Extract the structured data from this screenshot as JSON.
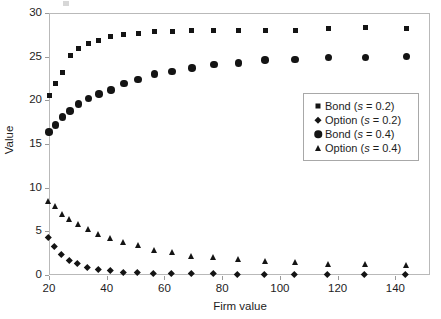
{
  "chart_data": {
    "type": "scatter",
    "title": "",
    "xlabel": "Firm value",
    "ylabel": "Value",
    "xlim": [
      20,
      152
    ],
    "ylim": [
      0,
      30
    ],
    "xticks": [
      20,
      40,
      60,
      80,
      100,
      120,
      140
    ],
    "yticks": [
      0,
      5,
      10,
      15,
      20,
      25,
      30
    ],
    "grid": false,
    "legend_position": "upper-right-inside",
    "x": [
      20,
      22.2,
      24.6,
      27.3,
      30.3,
      33.6,
      37.3,
      41.4,
      45.9,
      50.9,
      56.5,
      62.7,
      69.5,
      77.1,
      85.6,
      94.9,
      105.3,
      116.8,
      129.6,
      143.8
    ],
    "series": [
      {
        "name": "Bond (s = 0.2)",
        "marker": "square",
        "color": "#141414",
        "values": [
          20.6,
          21.9,
          23.2,
          25.1,
          25.9,
          26.5,
          26.9,
          27.3,
          27.5,
          27.7,
          27.9,
          27.9,
          28.0,
          28.0,
          28.0,
          28.0,
          28.0,
          28.2,
          28.3,
          28.2
        ]
      },
      {
        "name": "Option (s = 0.2)",
        "marker": "diamond",
        "color": "#141414",
        "values": [
          4.2,
          3.2,
          2.3,
          1.6,
          1.2,
          0.8,
          0.5,
          0.4,
          0.25,
          0.2,
          0.1,
          0.1,
          0.05,
          0.05,
          0.0,
          0.0,
          0.0,
          0.0,
          0.0,
          0.0
        ]
      },
      {
        "name": "Bond (s = 0.4)",
        "marker": "circle",
        "color": "#141414",
        "values": [
          16.4,
          17.2,
          18.1,
          18.8,
          19.6,
          20.2,
          20.7,
          21.2,
          21.9,
          22.4,
          23.0,
          23.3,
          23.7,
          24.1,
          24.3,
          24.6,
          24.7,
          24.9,
          24.9,
          25.0
        ]
      },
      {
        "name": "Option (s = 0.4)",
        "marker": "triangle",
        "color": "#141414",
        "values": [
          8.5,
          7.9,
          7.0,
          6.4,
          5.8,
          5.3,
          4.7,
          4.2,
          3.8,
          3.4,
          2.9,
          2.6,
          2.2,
          2.0,
          1.8,
          1.6,
          1.5,
          1.3,
          1.2,
          1.1
        ]
      }
    ]
  },
  "axis": {
    "y_title": "Value",
    "x_title": "Firm value",
    "y_tick_labels": [
      "0",
      "5",
      "10",
      "15",
      "20",
      "25",
      "30"
    ],
    "x_tick_labels": [
      "20",
      "40",
      "60",
      "80",
      "100",
      "120",
      "140"
    ]
  },
  "legend": {
    "entries": [
      {
        "label": "Bond (s = 0.2)",
        "marker": "square"
      },
      {
        "label": "Option (s = 0.2)",
        "marker": "diamond"
      },
      {
        "label": "Bond (s = 0.4)",
        "marker": "circle"
      },
      {
        "label": "Option (s = 0.4)",
        "marker": "triangle"
      }
    ]
  }
}
